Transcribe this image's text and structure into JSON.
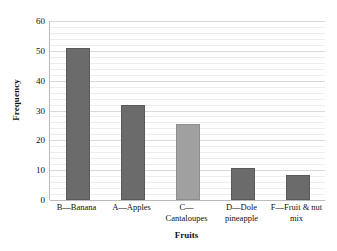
{
  "chart_data": {
    "type": "bar",
    "title": "",
    "xlabel": "Fruits",
    "ylabel": "Frequency",
    "categories": [
      "B—Banana",
      "A—Apples",
      "C—Cantaloupes",
      "D—Dole pineapple",
      "F—Fruit & nut mix"
    ],
    "values": [
      51,
      32,
      25.5,
      10.7,
      8.4
    ],
    "bar_colors": [
      "#6b6b6b",
      "#6b6b6b",
      "#a0a0a0",
      "#6b6b6b",
      "#6b6b6b"
    ],
    "ylim": [
      0,
      60
    ],
    "ytick_labels": [
      "0",
      "10",
      "20",
      "30",
      "40",
      "50",
      "60"
    ],
    "ytick_values": [
      0,
      10,
      20,
      30,
      40,
      50,
      60
    ],
    "minor_gridline_step": 2,
    "grid": true,
    "legend": "none"
  },
  "axes": {
    "y_title": "Frequency",
    "x_title": "Fruits"
  },
  "colors": {
    "bar_dark": "#6b6b6b",
    "bar_light": "#a0a0a0",
    "gridline": "#d9d9d9",
    "gridline_minor": "#ededed",
    "axis": "#b9b9b9",
    "text": "#111111",
    "background": "#ffffff"
  }
}
